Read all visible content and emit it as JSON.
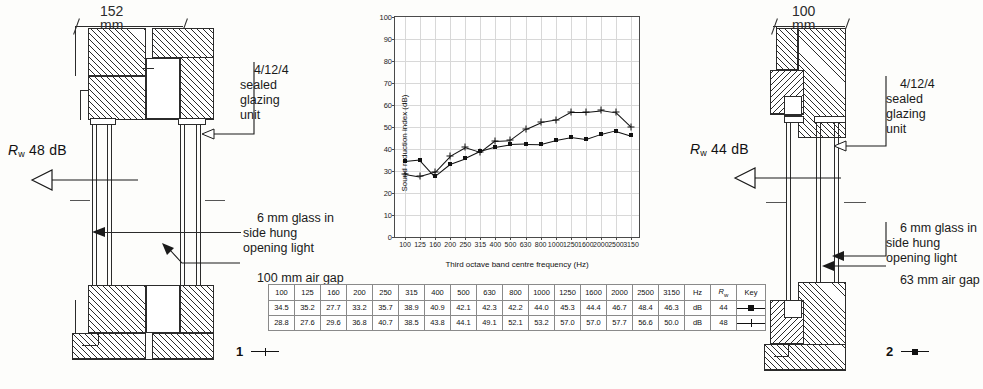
{
  "figure": {
    "left_detail": {
      "dimension": "152 mm",
      "rating_prefix": "R",
      "rating_sub": "w",
      "rating_value": "48 dB",
      "rating_full": "Rw 48 dB",
      "callouts": [
        "4/12/4\nsealed\nglazing\nunit",
        "6 mm glass in\nside hung\nopening light",
        "100 mm air gap"
      ],
      "series_number": "1"
    },
    "right_detail": {
      "dimension": "100 mm",
      "rating_prefix": "R",
      "rating_sub": "w",
      "rating_value": "44 dB",
      "rating_full": "Rw 44 dB",
      "callouts": [
        "4/12/4\nsealed\nglazing\nunit",
        "6 mm glass in\nside hung\nopening light",
        "63 mm air gap"
      ],
      "series_number": "2"
    }
  },
  "chart_data": {
    "type": "line",
    "title": "",
    "xlabel": "Third octave band centre frequency (Hz)",
    "ylabel": "Sound reduction index (dB)",
    "ylim": [
      0,
      100
    ],
    "ytick_step": 10,
    "grid": true,
    "legend_position": "table",
    "categories": [
      "100",
      "125",
      "160",
      "200",
      "250",
      "315",
      "400",
      "500",
      "630",
      "800",
      "1000",
      "1250",
      "1600",
      "2000",
      "2500",
      "3150"
    ],
    "series": [
      {
        "name": "2",
        "marker": "square",
        "rw": "44",
        "values": [
          34.5,
          35.2,
          27.7,
          33.2,
          35.7,
          38.9,
          40.9,
          42.1,
          42.3,
          42.2,
          44.0,
          45.3,
          44.4,
          46.7,
          48.4,
          46.3
        ]
      },
      {
        "name": "1",
        "marker": "cross",
        "rw": "48",
        "values": [
          28.8,
          27.6,
          29.6,
          36.8,
          40.7,
          38.5,
          43.8,
          44.1,
          49.1,
          52.1,
          53.2,
          57.0,
          57.0,
          57.7,
          56.6,
          50.0
        ]
      }
    ]
  },
  "table": {
    "freq_headers": [
      "100",
      "125",
      "160",
      "200",
      "250",
      "315",
      "400",
      "500",
      "630",
      "800",
      "1000",
      "1250",
      "1600",
      "2000",
      "2500",
      "3150"
    ],
    "unit_header": "Hz",
    "rw_header": "Rw",
    "rw_header_prefix": "R",
    "rw_header_sub": "w",
    "key_header": "Key",
    "rows": [
      {
        "values": [
          "34.5",
          "35.2",
          "27.7",
          "33.2",
          "35.7",
          "38.9",
          "40.9",
          "42.1",
          "42.3",
          "42.2",
          "44.0",
          "45.3",
          "44.4",
          "46.7",
          "48.4",
          "46.3"
        ],
        "unit": "dB",
        "rw": "44",
        "key_marker": "square-marker",
        "series_number": "2"
      },
      {
        "values": [
          "28.8",
          "27.6",
          "29.6",
          "36.8",
          "40.7",
          "38.5",
          "43.8",
          "44.1",
          "49.1",
          "52.1",
          "53.2",
          "57.0",
          "57.0",
          "57.7",
          "56.6",
          "50.0"
        ],
        "unit": "dB",
        "rw": "48",
        "key_marker": "cross-marker",
        "series_number": "1"
      }
    ]
  },
  "legend": {
    "left": {
      "number": "1",
      "marker": "cross-marker"
    },
    "right": {
      "number": "2",
      "marker": "square-marker"
    }
  },
  "colors": {
    "ink": "#1a1a1a",
    "grid": "#d8d8d8",
    "axis": "#4a4a4a",
    "paper": "#fdfdfb"
  }
}
